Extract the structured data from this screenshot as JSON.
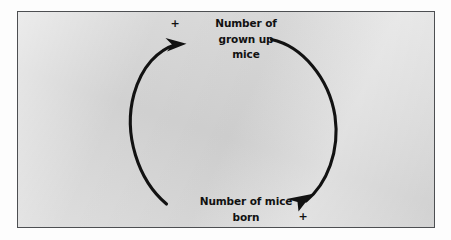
{
  "figure": {
    "type": "causal-loop-diagram",
    "background_color": "#d5d5d5",
    "border_color": "#4d4f52",
    "stroke_color": "#121212",
    "text_color": "#111111"
  },
  "nodes": [
    {
      "id": "grown-up-mice",
      "label": "Number of\ngrown up\nmice",
      "position": "top"
    },
    {
      "id": "mice-born",
      "label": "Number of mice\nborn",
      "position": "bottom"
    }
  ],
  "links": [
    {
      "id": "born-to-grown",
      "from": "mice-born",
      "to": "grown-up-mice",
      "polarity": "+",
      "side": "left",
      "direction": "upward"
    },
    {
      "id": "grown-to-born",
      "from": "grown-up-mice",
      "to": "mice-born",
      "polarity": "+",
      "side": "right",
      "direction": "downward"
    }
  ],
  "polarity_labels": {
    "top_left": "+",
    "bottom_right": "+"
  }
}
